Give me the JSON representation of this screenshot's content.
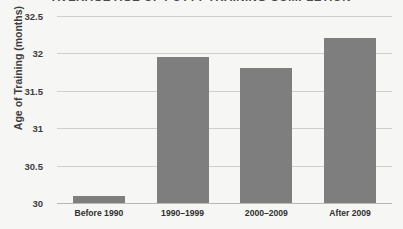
{
  "chart_data": {
    "type": "bar",
    "title": "AVERAGE AGE OF POTTY TRAINING COMPLETION",
    "xlabel": "",
    "ylabel": "Age of Training (months)",
    "categories": [
      "Before 1990",
      "1990–1999",
      "2000–2009",
      "After 2009"
    ],
    "values": [
      30.1,
      31.95,
      31.8,
      32.2
    ],
    "ylim": [
      30,
      32.5
    ],
    "ytick_labels": [
      "32.5",
      "32",
      "31.5",
      "31",
      "30.5",
      "30"
    ],
    "yticks": [
      32.5,
      32,
      31.5,
      31,
      30.5,
      30
    ],
    "grid": true,
    "legend": "none",
    "bar_color": "#7e7e7e",
    "background_color": "#f6f6f4",
    "gridline_color": "#cfcfcb"
  }
}
